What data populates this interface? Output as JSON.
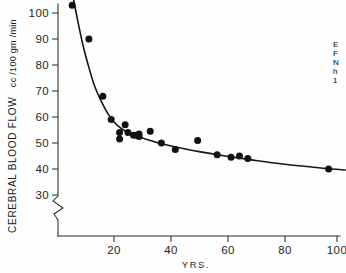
{
  "chart_data": {
    "type": "scatter",
    "title": "",
    "xlabel": "YRS.",
    "ylabel": "CEREBRAL BLOOD FLOW",
    "ylabel_unit": "cc /100 gm /min",
    "xlim": [
      0,
      103
    ],
    "ylim": [
      28,
      106
    ],
    "yaxis_break_below": 30,
    "grid": false,
    "legend_position": "none",
    "xticks": [
      20,
      40,
      60,
      80,
      100
    ],
    "yticks": [
      30,
      40,
      50,
      60,
      70,
      80,
      90,
      100
    ],
    "x": [
      5,
      11,
      16,
      19,
      22,
      22,
      24,
      25,
      27,
      28,
      29,
      29,
      33,
      37,
      42,
      50,
      57,
      62,
      65,
      68,
      97
    ],
    "y": [
      103,
      90,
      68,
      59,
      51.5,
      54,
      57,
      54,
      53,
      53,
      53.5,
      52.5,
      54.5,
      50,
      47.5,
      51,
      45.5,
      44.5,
      45,
      44,
      40
    ],
    "points": [
      {
        "x": 5,
        "y": 103
      },
      {
        "x": 11,
        "y": 90
      },
      {
        "x": 16,
        "y": 68
      },
      {
        "x": 19,
        "y": 59
      },
      {
        "x": 22,
        "y": 51.5
      },
      {
        "x": 22,
        "y": 54
      },
      {
        "x": 24,
        "y": 57
      },
      {
        "x": 25,
        "y": 54
      },
      {
        "x": 27,
        "y": 53
      },
      {
        "x": 28,
        "y": 53
      },
      {
        "x": 29,
        "y": 53.5
      },
      {
        "x": 29,
        "y": 52.5
      },
      {
        "x": 33,
        "y": 54.5
      },
      {
        "x": 37,
        "y": 50
      },
      {
        "x": 42,
        "y": 47.5
      },
      {
        "x": 50,
        "y": 51
      },
      {
        "x": 57,
        "y": 45.5
      },
      {
        "x": 62,
        "y": 44.5
      },
      {
        "x": 65,
        "y": 45
      },
      {
        "x": 68,
        "y": 44
      },
      {
        "x": 97,
        "y": 40
      }
    ],
    "fit_curve": {
      "description": "monotonic decreasing hyperbolic fit of blood flow versus age",
      "x": [
        5,
        7,
        9,
        11,
        13,
        15,
        18,
        21,
        25,
        30,
        36,
        43,
        51,
        60,
        70,
        82,
        95,
        103
      ],
      "y": [
        108,
        97,
        87,
        79,
        72,
        67,
        61,
        57,
        54,
        52,
        50,
        48.3,
        46.6,
        45,
        43.4,
        41.7,
        40.3,
        39.6
      ]
    },
    "annotations": []
  },
  "edge_text": {
    "cropped_lines": [
      "E",
      "F",
      "N",
      "h",
      "1"
    ]
  }
}
